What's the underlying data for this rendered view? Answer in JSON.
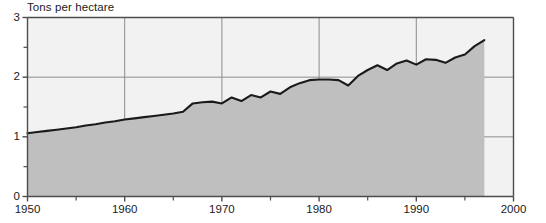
{
  "chart_data": {
    "type": "area",
    "title": "Tons per hectare",
    "xlabel": "",
    "ylabel": "Tons per hectare",
    "xlim": [
      1950,
      2000
    ],
    "ylim": [
      0,
      3
    ],
    "grid": true,
    "legend": "none",
    "y_ticks_major": [
      "0",
      "1",
      "2",
      "3"
    ],
    "y_tick_values": [
      0,
      1,
      2,
      3
    ],
    "y_minor_tick_values": [
      0.5,
      1.5,
      2.5
    ],
    "x_ticks_major": [
      "1950",
      "1960",
      "1970",
      "1980",
      "1990",
      "2000"
    ],
    "x_tick_values": [
      1950,
      1960,
      1970,
      1980,
      1990,
      2000
    ],
    "x_minor_tick_values": [
      1955,
      1965,
      1975,
      1985,
      1995
    ],
    "series": [
      {
        "name": "Tons per hectare",
        "x": [
          1950,
          1951,
          1952,
          1953,
          1954,
          1955,
          1956,
          1957,
          1958,
          1959,
          1960,
          1961,
          1962,
          1963,
          1964,
          1965,
          1966,
          1967,
          1968,
          1969,
          1970,
          1971,
          1972,
          1973,
          1974,
          1975,
          1976,
          1977,
          1978,
          1979,
          1980,
          1981,
          1982,
          1983,
          1984,
          1985,
          1986,
          1987,
          1988,
          1989,
          1990,
          1991,
          1992,
          1993,
          1994,
          1995,
          1996,
          1997
        ],
        "values": [
          1.06,
          1.08,
          1.1,
          1.12,
          1.14,
          1.16,
          1.19,
          1.21,
          1.24,
          1.26,
          1.29,
          1.31,
          1.33,
          1.35,
          1.37,
          1.39,
          1.42,
          1.56,
          1.58,
          1.59,
          1.56,
          1.66,
          1.6,
          1.7,
          1.66,
          1.76,
          1.72,
          1.83,
          1.9,
          1.95,
          1.96,
          1.96,
          1.95,
          1.86,
          2.02,
          2.12,
          2.2,
          2.12,
          2.23,
          2.28,
          2.21,
          2.3,
          2.29,
          2.24,
          2.33,
          2.38,
          2.52,
          2.62
        ]
      }
    ]
  },
  "style": {
    "fill_color": "#bfbfbf",
    "plot_background": "#f2f2f2",
    "line_color": "#1a1a1a",
    "grid_color": "#8c8c8c",
    "axis_color": "#4d4d4d",
    "page_background": "#ffffff"
  }
}
